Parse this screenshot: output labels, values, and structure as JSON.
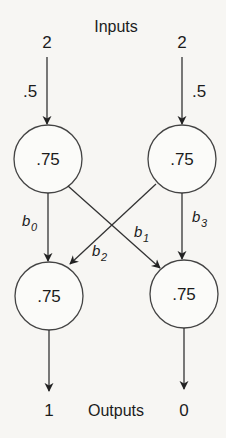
{
  "diagram": {
    "inputs_label": "Inputs",
    "outputs_label": "Outputs",
    "inputs": [
      {
        "value": "2",
        "weight": ".5"
      },
      {
        "value": "2",
        "weight": ".5"
      }
    ],
    "hidden_nodes": [
      {
        "value": ".75"
      },
      {
        "value": ".75"
      }
    ],
    "output_nodes": [
      {
        "value": ".75"
      },
      {
        "value": ".75"
      }
    ],
    "outputs": [
      {
        "value": "1"
      },
      {
        "value": "0"
      }
    ],
    "edges": [
      {
        "from": "hidden-0",
        "to": "output-0",
        "label": "b",
        "sub": "0"
      },
      {
        "from": "hidden-0",
        "to": "output-1",
        "label": "b",
        "sub": "1"
      },
      {
        "from": "hidden-1",
        "to": "output-0",
        "label": "b",
        "sub": "2"
      },
      {
        "from": "hidden-1",
        "to": "output-1",
        "label": "b",
        "sub": "3"
      }
    ],
    "colors": {
      "ink": "#1c1c1c",
      "background": "#f7f6f3"
    }
  }
}
